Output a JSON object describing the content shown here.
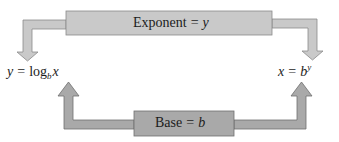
{
  "diagram": {
    "type": "logarithm-exponent-relationship",
    "colors": {
      "exponent_fill": "#c9c9c9",
      "exponent_stroke": "#8a8a8a",
      "base_fill": "#a9a9a9",
      "base_stroke": "#6f6f6f",
      "text": "#1c1c1c",
      "background": "#ffffff"
    },
    "exponent_box": {
      "word": "Exponent",
      "equals": "=",
      "variable": "y"
    },
    "base_box": {
      "word": "Base",
      "equals": "=",
      "variable": "b"
    },
    "log_form": {
      "lhs": "y",
      "equals": "=",
      "func": "log",
      "subscript": "b",
      "arg": "x"
    },
    "exp_form": {
      "lhs": "x",
      "equals": "=",
      "base": "b",
      "superscript": "y"
    },
    "arrows": [
      {
        "from": "exponent_box",
        "to": "log_form",
        "direction": "down"
      },
      {
        "from": "exponent_box",
        "to": "exp_form",
        "direction": "down"
      },
      {
        "from": "base_box",
        "to": "log_form",
        "direction": "up"
      },
      {
        "from": "base_box",
        "to": "exp_form",
        "direction": "up"
      }
    ]
  }
}
